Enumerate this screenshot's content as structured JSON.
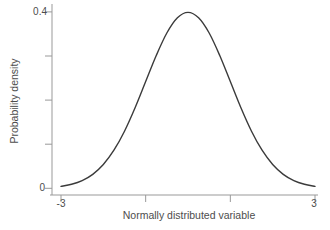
{
  "figure": {
    "xlabel": "Normally distributed variable",
    "ylabel": "Probability density"
  },
  "chart_data": {
    "type": "line",
    "title": "",
    "xlabel": "Normally distributed variable",
    "ylabel": "Probability density",
    "xlim": [
      -3,
      3
    ],
    "ylim": [
      0,
      0.4
    ],
    "x_ticks": [
      -3,
      -1,
      1,
      3
    ],
    "x_tick_labels": [
      "-3",
      "",
      "",
      "3"
    ],
    "y_ticks": [
      0,
      0.1,
      0.2,
      0.3,
      0.4
    ],
    "y_tick_labels": [
      "0",
      "",
      "",
      "",
      "0.4"
    ],
    "grid": false,
    "legend": null,
    "series": [
      {
        "name": "standard normal pdf",
        "formula": "y = exp(-x^2/2) / sqrt(2*pi)",
        "x": [
          -3,
          -2.75,
          -2.5,
          -2.25,
          -2,
          -1.75,
          -1.5,
          -1.25,
          -1,
          -0.75,
          -0.5,
          -0.25,
          0,
          0.25,
          0.5,
          0.75,
          1,
          1.25,
          1.5,
          1.75,
          2,
          2.25,
          2.5,
          2.75,
          3
        ],
        "y": [
          0.0044,
          0.0091,
          0.0175,
          0.0317,
          0.054,
          0.0863,
          0.1295,
          0.1826,
          0.242,
          0.3011,
          0.3521,
          0.3867,
          0.3989,
          0.3867,
          0.3521,
          0.3011,
          0.242,
          0.1826,
          0.1295,
          0.0863,
          0.054,
          0.0317,
          0.0175,
          0.0091,
          0.0044
        ]
      }
    ],
    "colors": {
      "curve": "#3b3b3b",
      "axis": "#999999",
      "text": "#4d4d4d",
      "background": "#ffffff"
    }
  }
}
